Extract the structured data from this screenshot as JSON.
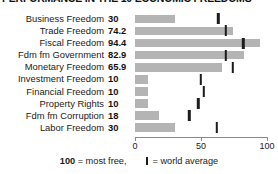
{
  "chart_data": {
    "type": "bar",
    "title": "PERFORMANCE IN THE 10 ECONOMIC FREEDOMS",
    "orientation": "horizontal",
    "xlabel": "",
    "ylabel": "",
    "xlim": [
      0,
      100
    ],
    "grid": false,
    "axis_ticks": [
      0,
      50,
      100
    ],
    "axis_tick_labels": [
      "0",
      "50",
      "100"
    ],
    "categories": [
      "Business Freedom",
      "Trade Freedom",
      "Fiscal Freedom",
      "Fdm fm Government",
      "Monetary Freedom",
      "Investment Freedom",
      "Financial Freedom",
      "Property Rights",
      "Fdm fm Corruption",
      "Labor Freedom"
    ],
    "series": [
      {
        "name": "Country score",
        "values": [
          30,
          74.2,
          94.4,
          82.9,
          65.9,
          10,
          10,
          10,
          18,
          30
        ],
        "value_labels": [
          "30",
          "74.2",
          "94.4",
          "82.9",
          "65.9",
          "10",
          "10",
          "10",
          "18",
          "30"
        ],
        "color": "#b4b4b4"
      },
      {
        "name": "World average",
        "marker": "tick",
        "values": [
          63,
          69,
          82,
          69,
          74,
          50,
          52,
          48,
          41,
          62
        ],
        "color": "#1c1c1c"
      }
    ],
    "legend": {
      "position": "bottom",
      "most_free_value": "100",
      "most_free_text": "= most free,",
      "world_average_text": "= world average"
    }
  }
}
